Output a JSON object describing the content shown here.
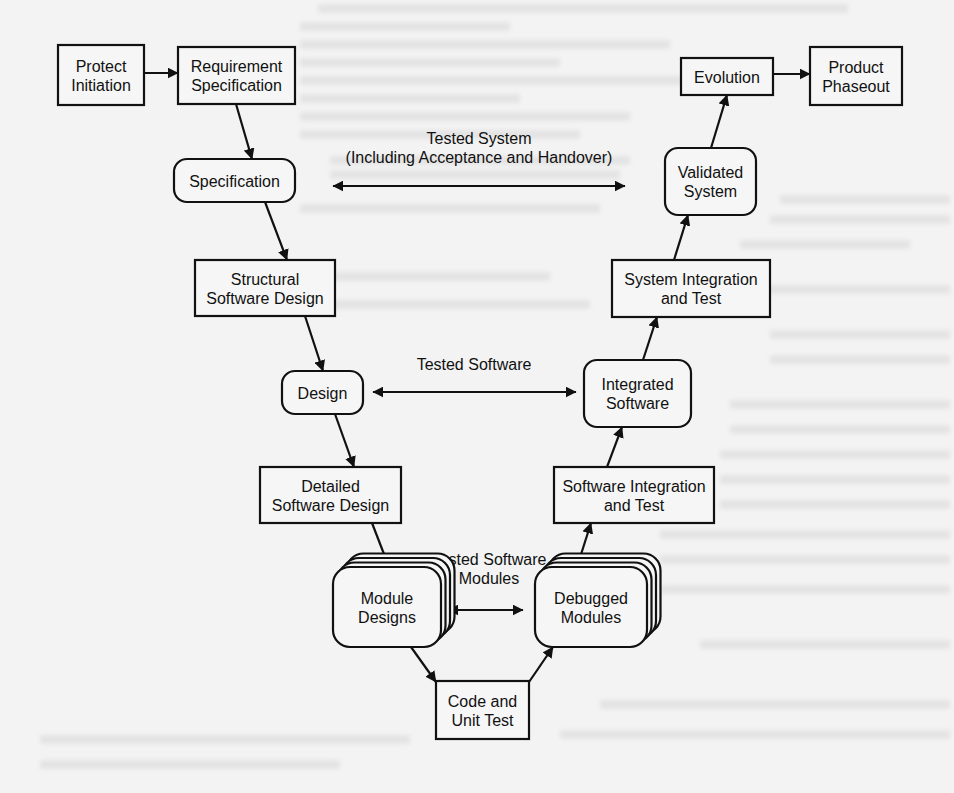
{
  "diagram": {
    "type": "software-lifecycle-v-model",
    "nodes": [
      {
        "id": "project_initiation",
        "lines": [
          "Protect",
          "Initiation"
        ],
        "shape": "rect",
        "x": 58,
        "y": 45,
        "w": 86,
        "h": 60
      },
      {
        "id": "requirement_specification",
        "lines": [
          "Requirement",
          "Specification"
        ],
        "shape": "rect",
        "x": 178,
        "y": 47,
        "w": 117,
        "h": 57
      },
      {
        "id": "specification",
        "lines": [
          "Specification"
        ],
        "shape": "rounded",
        "x": 174,
        "y": 159,
        "w": 121,
        "h": 43
      },
      {
        "id": "structural_software_design",
        "lines": [
          "Structural",
          "Software Design"
        ],
        "shape": "rect",
        "x": 195,
        "y": 260,
        "w": 140,
        "h": 56
      },
      {
        "id": "design",
        "lines": [
          "Design"
        ],
        "shape": "rounded",
        "x": 282,
        "y": 371,
        "w": 81,
        "h": 43
      },
      {
        "id": "detailed_software_design",
        "lines": [
          "Detailed",
          "Software Design"
        ],
        "shape": "rect",
        "x": 260,
        "y": 467,
        "w": 141,
        "h": 56
      },
      {
        "id": "module_designs",
        "lines": [
          "Module",
          "Designs"
        ],
        "shape": "stacked",
        "x": 333,
        "y": 567,
        "w": 108,
        "h": 80
      },
      {
        "id": "code_and_unit_test",
        "lines": [
          "Code and",
          "Unit Test"
        ],
        "shape": "rect",
        "x": 436,
        "y": 681,
        "w": 93,
        "h": 58
      },
      {
        "id": "debugged_modules",
        "lines": [
          "Debugged",
          "Modules"
        ],
        "shape": "stacked",
        "x": 535,
        "y": 567,
        "w": 112,
        "h": 80
      },
      {
        "id": "software_integration_and_test",
        "lines": [
          "Software Integration",
          "and Test"
        ],
        "shape": "rect",
        "x": 554,
        "y": 467,
        "w": 160,
        "h": 56
      },
      {
        "id": "integrated_software",
        "lines": [
          "Integrated",
          "Software"
        ],
        "shape": "rounded",
        "x": 584,
        "y": 360,
        "w": 107,
        "h": 67
      },
      {
        "id": "system_integration_and_test",
        "lines": [
          "System Integration",
          "and Test"
        ],
        "shape": "rect",
        "x": 612,
        "y": 260,
        "w": 158,
        "h": 57
      },
      {
        "id": "validated_system",
        "lines": [
          "Validated",
          "System"
        ],
        "shape": "rounded",
        "x": 665,
        "y": 148,
        "w": 91,
        "h": 67
      },
      {
        "id": "evolution",
        "lines": [
          "Evolution"
        ],
        "shape": "rect",
        "x": 681,
        "y": 58,
        "w": 92,
        "h": 37
      },
      {
        "id": "product_phaseout",
        "lines": [
          "Product",
          "Phaseout"
        ],
        "shape": "rect",
        "x": 810,
        "y": 47,
        "w": 92,
        "h": 58
      }
    ],
    "edges": [
      {
        "from": "project_initiation",
        "to": "requirement_specification",
        "x1": 144,
        "y1": 73,
        "x2": 178,
        "y2": 73
      },
      {
        "from": "requirement_specification",
        "to": "specification",
        "x1": 236,
        "y1": 104,
        "x2": 252,
        "y2": 159
      },
      {
        "from": "specification",
        "to": "structural_software_design",
        "x1": 265,
        "y1": 202,
        "x2": 287,
        "y2": 260
      },
      {
        "from": "structural_software_design",
        "to": "design",
        "x1": 305,
        "y1": 316,
        "x2": 323,
        "y2": 371
      },
      {
        "from": "design",
        "to": "detailed_software_design",
        "x1": 335,
        "y1": 414,
        "x2": 354,
        "y2": 467
      },
      {
        "from": "detailed_software_design",
        "to": "module_designs",
        "x1": 372,
        "y1": 523,
        "x2": 389,
        "y2": 567
      },
      {
        "from": "module_designs",
        "to": "code_and_unit_test",
        "x1": 411,
        "y1": 647,
        "x2": 436,
        "y2": 682
      },
      {
        "from": "code_and_unit_test",
        "to": "debugged_modules",
        "x1": 529,
        "y1": 682,
        "x2": 553,
        "y2": 647
      },
      {
        "from": "debugged_modules",
        "to": "software_integration_and_test",
        "x1": 577,
        "y1": 567,
        "x2": 591,
        "y2": 523
      },
      {
        "from": "software_integration_and_test",
        "to": "integrated_software",
        "x1": 607,
        "y1": 467,
        "x2": 622,
        "y2": 427
      },
      {
        "from": "integrated_software",
        "to": "system_integration_and_test",
        "x1": 643,
        "y1": 360,
        "x2": 657,
        "y2": 317
      },
      {
        "from": "system_integration_and_test",
        "to": "validated_system",
        "x1": 674,
        "y1": 260,
        "x2": 688,
        "y2": 215
      },
      {
        "from": "validated_system",
        "to": "evolution",
        "x1": 711,
        "y1": 148,
        "x2": 727,
        "y2": 95
      },
      {
        "from": "evolution",
        "to": "product_phaseout",
        "x1": 773,
        "y1": 74,
        "x2": 810,
        "y2": 74
      }
    ],
    "correspondences": [
      {
        "id": "tested_system",
        "lines": [
          "Tested System",
          "(Including Acceptance and Handover)"
        ],
        "between": [
          "specification",
          "validated_system"
        ],
        "x1": 333,
        "x2": 625,
        "y": 186,
        "label_x": 479,
        "label_y": 144
      },
      {
        "id": "tested_software",
        "lines": [
          "Tested Software"
        ],
        "between": [
          "design",
          "integrated_software"
        ],
        "x1": 373,
        "x2": 576,
        "y": 392,
        "label_x": 474,
        "label_y": 370
      },
      {
        "id": "tested_software_modules",
        "lines": [
          "Tested Software",
          "Modules"
        ],
        "between": [
          "module_designs",
          "debugged_modules"
        ],
        "x1": 448,
        "x2": 523,
        "y": 610,
        "label_x": 489,
        "label_y": 565
      }
    ]
  },
  "background": {
    "ghost_text_lines": [
      {
        "x": 318,
        "y": 4,
        "w": 530
      },
      {
        "x": 300,
        "y": 22,
        "w": 210
      },
      {
        "x": 300,
        "y": 40,
        "w": 370
      },
      {
        "x": 300,
        "y": 58,
        "w": 260
      },
      {
        "x": 300,
        "y": 76,
        "w": 400
      },
      {
        "x": 300,
        "y": 94,
        "w": 220
      },
      {
        "x": 300,
        "y": 112,
        "w": 330
      },
      {
        "x": 300,
        "y": 130,
        "w": 280
      },
      {
        "x": 330,
        "y": 156,
        "w": 300
      },
      {
        "x": 330,
        "y": 170,
        "w": 290
      },
      {
        "x": 300,
        "y": 204,
        "w": 300
      },
      {
        "x": 780,
        "y": 195,
        "w": 170
      },
      {
        "x": 770,
        "y": 215,
        "w": 180
      },
      {
        "x": 740,
        "y": 240,
        "w": 170
      },
      {
        "x": 330,
        "y": 272,
        "w": 220
      },
      {
        "x": 720,
        "y": 285,
        "w": 230
      },
      {
        "x": 260,
        "y": 300,
        "w": 330
      },
      {
        "x": 770,
        "y": 330,
        "w": 180
      },
      {
        "x": 770,
        "y": 355,
        "w": 180
      },
      {
        "x": 730,
        "y": 400,
        "w": 220
      },
      {
        "x": 730,
        "y": 425,
        "w": 220
      },
      {
        "x": 720,
        "y": 450,
        "w": 230
      },
      {
        "x": 720,
        "y": 475,
        "w": 230
      },
      {
        "x": 720,
        "y": 500,
        "w": 230
      },
      {
        "x": 660,
        "y": 530,
        "w": 290
      },
      {
        "x": 660,
        "y": 555,
        "w": 290
      },
      {
        "x": 660,
        "y": 585,
        "w": 290
      },
      {
        "x": 700,
        "y": 640,
        "w": 250
      },
      {
        "x": 600,
        "y": 700,
        "w": 350
      },
      {
        "x": 560,
        "y": 730,
        "w": 390
      },
      {
        "x": 40,
        "y": 735,
        "w": 370
      },
      {
        "x": 40,
        "y": 760,
        "w": 300
      }
    ]
  }
}
